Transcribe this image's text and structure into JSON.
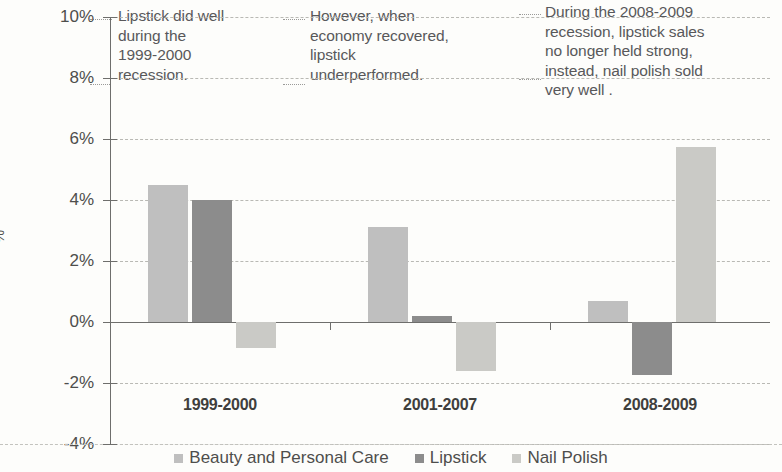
{
  "chart_data": {
    "type": "bar",
    "title": "",
    "subtitle": "",
    "xlabel": "",
    "ylabel": "%",
    "categories": [
      "1999-2000",
      "2001-2007",
      "2008-2009"
    ],
    "series": [
      {
        "name": "Beauty and Personal Care",
        "color": "#bfbfbf",
        "values": [
          4.5,
          3.1,
          0.7
        ]
      },
      {
        "name": "Lipstick",
        "color": "#8c8c8c",
        "values": [
          4.0,
          0.2,
          -1.75
        ]
      },
      {
        "name": "Nail Polish",
        "color": "#cacac6",
        "values": [
          -0.85,
          -1.6,
          5.75
        ]
      }
    ],
    "ylim": [
      -4,
      10
    ],
    "ytick_values": [
      10,
      8,
      6,
      4,
      2,
      0,
      -2,
      -4
    ],
    "ytick_labels": [
      "10%",
      "8%",
      "6%",
      "4%",
      "2%",
      "0%",
      "-2%",
      "-4%"
    ],
    "grid": true,
    "grid_style": "dashed horizontal",
    "legend_position": "bottom",
    "annotations": [
      {
        "id": "ann-0",
        "text": "Lipstick did well during the 1999-2000 recession."
      },
      {
        "id": "ann-1",
        "text": "However, when economy recovered, lipstick underperformed."
      },
      {
        "id": "ann-2",
        "text": "During the 2008-2009 recession, lipstick sales no longer held strong, instead,  nail polish sold very well ."
      }
    ]
  },
  "axis": {
    "ylabels": [
      "10%",
      "8%",
      "6%",
      "4%",
      "2%",
      "0%",
      "-2%",
      "-4%"
    ],
    "title": "%"
  },
  "categories": {
    "c0": "1999-2000",
    "c1": "2001-2007",
    "c2": "2008-2009"
  },
  "legend": {
    "items": [
      {
        "label": "Beauty and Personal Care",
        "color": "#bfbfbf"
      },
      {
        "label": "Lipstick",
        "color": "#8c8c8c"
      },
      {
        "label": "Nail Polish",
        "color": "#cacac6"
      }
    ]
  },
  "annotations": {
    "a0": "Lipstick did well\nduring the\n1999-2000\nrecession.",
    "a1": "However, when\neconomy recovered,\nlipstick\nunderperformed.",
    "a2": "During the 2008-2009\nrecession, lipstick sales\nno longer held strong,\ninstead,  nail polish sold\nvery well ."
  }
}
